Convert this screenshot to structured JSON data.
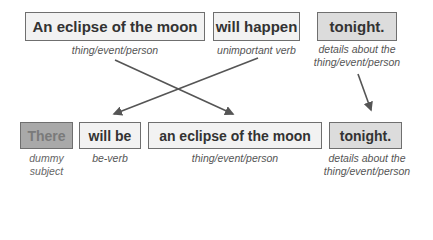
{
  "top_row": [
    {
      "text": "An eclipse of the moon",
      "label": [
        "thing/event/person"
      ],
      "fill": "#f2f2f2"
    },
    {
      "text": "will happen",
      "label": [
        "unimportant verb"
      ],
      "fill": "#f2f2f2"
    },
    {
      "text": "tonight.",
      "label": [
        "details about the",
        "thing/event/person"
      ],
      "fill": "#dcdcdc"
    }
  ],
  "bottom_row": [
    {
      "text": "There",
      "label": [
        "dummy",
        "subject"
      ],
      "fill": "#a9a9a9"
    },
    {
      "text": "will be",
      "label": [
        "be-verb"
      ],
      "fill": "#f2f2f2"
    },
    {
      "text": "an eclipse of the moon",
      "label": [
        "thing/event/person"
      ],
      "fill": "#f2f2f2"
    },
    {
      "text": "tonight.",
      "label": [
        "details about the",
        "thing/event/person"
      ],
      "fill": "#dcdcdc"
    }
  ],
  "arrows": [
    {
      "from": "top_row.0",
      "to": "bottom_row.2"
    },
    {
      "from": "top_row.1",
      "to": "bottom_row.1"
    },
    {
      "from": "top_row.2",
      "to": "bottom_row.3"
    }
  ],
  "colors": {
    "border": "#6f6f6f",
    "text": "#333333",
    "caption": "#555555",
    "arrow": "#555555"
  }
}
